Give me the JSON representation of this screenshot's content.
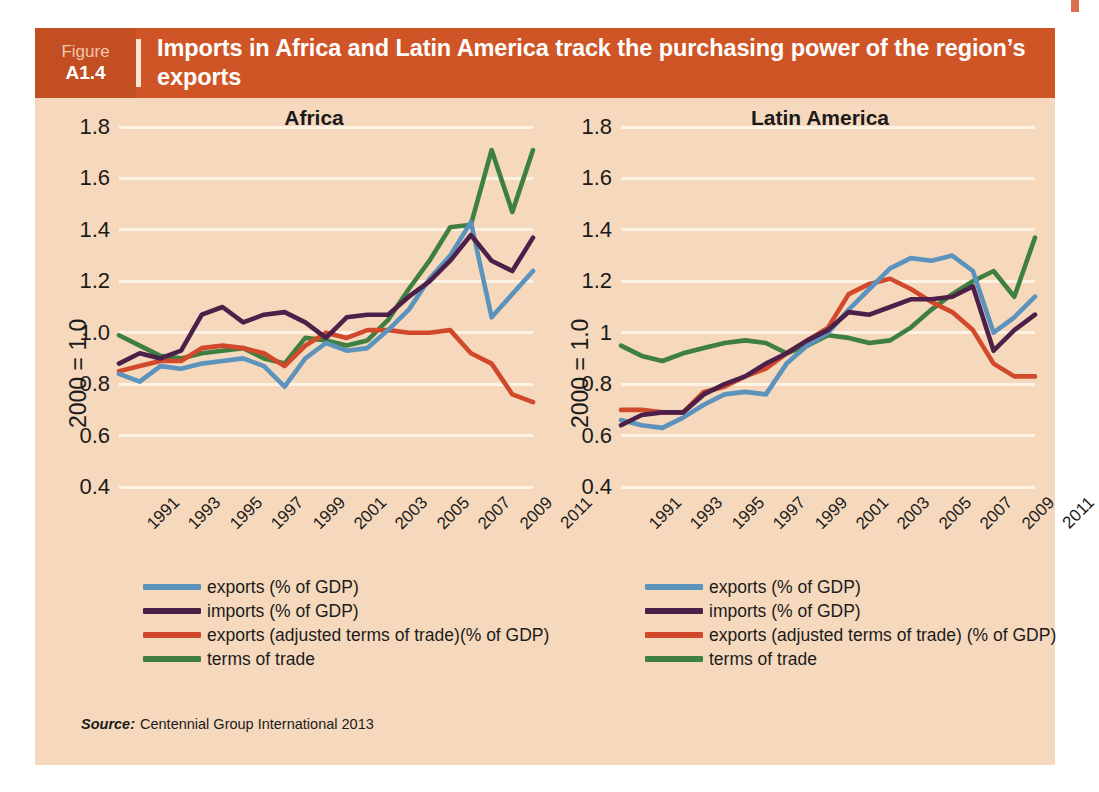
{
  "page": {
    "running_header": "",
    "corner_mark_color": "#d9714a"
  },
  "figure": {
    "label_word": "Figure",
    "number": "A1.4",
    "title": "Imports in Africa and Latin America track the purchasing power of the region’s exports",
    "header_bg": "#cf5526",
    "number_box_bg": "#c24e22",
    "panel_bg": "#f6d9bd",
    "source_word": "Source:",
    "source_text": "Centennial Group International 2013"
  },
  "series_colors": {
    "exports": "#5b93bd",
    "imports": "#4d2049",
    "exports_adjusted": "#d1482a",
    "terms_of_trade": "#3f7f3f"
  },
  "legend_africa": [
    {
      "key": "exports",
      "label": "exports  (% of GDP)"
    },
    {
      "key": "imports",
      "label": "imports  (% of GDP)"
    },
    {
      "key": "exports_adjusted",
      "label": "exports (adjusted terms of trade)(% of GDP)"
    },
    {
      "key": "terms_of_trade",
      "label": "terms of trade"
    }
  ],
  "legend_latam": [
    {
      "key": "exports",
      "label": "exports (% of GDP)"
    },
    {
      "key": "imports",
      "label": "imports (% of GDP)"
    },
    {
      "key": "exports_adjusted",
      "label": "exports (adjusted terms of trade) (% of GDP)"
    },
    {
      "key": "terms_of_trade",
      "label": "terms of trade"
    }
  ],
  "chart_data": [
    {
      "type": "line",
      "title": "Africa",
      "xlabel": "",
      "ylabel": "2000 = 1.0",
      "ylim": [
        0.4,
        1.8
      ],
      "yticks": [
        0.4,
        0.6,
        0.8,
        1.0,
        1.2,
        1.4,
        1.6,
        1.8
      ],
      "ytick_labels": [
        "0.4",
        "0.6",
        "0.8",
        "1.0",
        "1.2",
        "1.4",
        "1.6",
        "1.8"
      ],
      "grid": true,
      "legend_position": "below",
      "x": [
        1991,
        1992,
        1993,
        1994,
        1995,
        1996,
        1997,
        1998,
        1999,
        2000,
        2001,
        2002,
        2003,
        2004,
        2005,
        2006,
        2007,
        2008,
        2009,
        2010,
        2011
      ],
      "xtick_labels": [
        "1991",
        "1993",
        "1995",
        "1997",
        "1999",
        "2001",
        "2003",
        "2005",
        "2007",
        "2009",
        "2011"
      ],
      "series": [
        {
          "name": "exports  (% of GDP)",
          "key": "exports",
          "values": [
            0.84,
            0.81,
            0.87,
            0.86,
            0.88,
            0.89,
            0.9,
            0.87,
            0.79,
            0.9,
            0.96,
            0.93,
            0.94,
            1.01,
            1.09,
            1.21,
            1.3,
            1.43,
            1.06,
            1.15,
            1.24
          ]
        },
        {
          "name": "imports  (% of GDP)",
          "key": "imports",
          "values": [
            0.88,
            0.92,
            0.9,
            0.93,
            1.07,
            1.1,
            1.04,
            1.07,
            1.08,
            1.04,
            0.98,
            1.06,
            1.07,
            1.07,
            1.14,
            1.2,
            1.28,
            1.38,
            1.28,
            1.24,
            1.37
          ]
        },
        {
          "name": "exports (adjusted terms of trade)(% of GDP)",
          "key": "exports_adjusted",
          "values": [
            0.85,
            0.87,
            0.89,
            0.89,
            0.94,
            0.95,
            0.94,
            0.92,
            0.87,
            0.95,
            1.0,
            0.98,
            1.01,
            1.01,
            1.0,
            1.0,
            1.01,
            0.92,
            0.88,
            0.76,
            0.73
          ]
        },
        {
          "name": "terms of trade",
          "key": "terms_of_trade",
          "values": [
            0.99,
            0.95,
            0.91,
            0.9,
            0.92,
            0.93,
            0.94,
            0.9,
            0.88,
            0.98,
            0.97,
            0.95,
            0.97,
            1.05,
            1.17,
            1.28,
            1.41,
            1.42,
            1.71,
            1.47,
            1.71
          ]
        }
      ]
    },
    {
      "type": "line",
      "title": "Latin America",
      "xlabel": "",
      "ylabel": "2000 = 1.0",
      "ylim": [
        0.4,
        1.8
      ],
      "yticks": [
        0.4,
        0.6,
        0.8,
        1.0,
        1.2,
        1.4,
        1.6,
        1.8
      ],
      "ytick_labels": [
        "0.4",
        "0.6",
        "0.8",
        "1",
        "1.2",
        "1.4",
        "1.6",
        "1.8"
      ],
      "grid": true,
      "legend_position": "below",
      "x": [
        1991,
        1992,
        1993,
        1994,
        1995,
        1996,
        1997,
        1998,
        1999,
        2000,
        2001,
        2002,
        2003,
        2004,
        2005,
        2006,
        2007,
        2008,
        2009,
        2010,
        2011
      ],
      "xtick_labels": [
        "1991",
        "1993",
        "1995",
        "1997",
        "1999",
        "2001",
        "2003",
        "2005",
        "2007",
        "2009",
        "2011"
      ],
      "series": [
        {
          "name": "exports (% of GDP)",
          "key": "exports",
          "values": [
            0.66,
            0.64,
            0.63,
            0.67,
            0.72,
            0.76,
            0.77,
            0.76,
            0.88,
            0.95,
            1.0,
            1.09,
            1.17,
            1.25,
            1.29,
            1.28,
            1.3,
            1.24,
            1.0,
            1.06,
            1.14
          ]
        },
        {
          "name": "imports (% of GDP)",
          "key": "imports",
          "values": [
            0.64,
            0.68,
            0.69,
            0.69,
            0.76,
            0.8,
            0.83,
            0.88,
            0.92,
            0.97,
            1.01,
            1.08,
            1.07,
            1.1,
            1.13,
            1.13,
            1.14,
            1.18,
            0.93,
            1.01,
            1.07
          ]
        },
        {
          "name": "exports (adjusted terms of trade) (% of GDP)",
          "key": "exports_adjusted",
          "values": [
            0.7,
            0.7,
            0.69,
            0.69,
            0.77,
            0.79,
            0.83,
            0.86,
            0.92,
            0.97,
            1.02,
            1.15,
            1.19,
            1.21,
            1.17,
            1.12,
            1.08,
            1.01,
            0.88,
            0.83,
            0.83
          ]
        },
        {
          "name": "terms of trade",
          "key": "terms_of_trade",
          "values": [
            0.95,
            0.91,
            0.89,
            0.92,
            0.94,
            0.96,
            0.97,
            0.96,
            0.92,
            0.95,
            0.99,
            0.98,
            0.96,
            0.97,
            1.02,
            1.09,
            1.15,
            1.2,
            1.24,
            1.14,
            1.37
          ]
        }
      ]
    }
  ]
}
